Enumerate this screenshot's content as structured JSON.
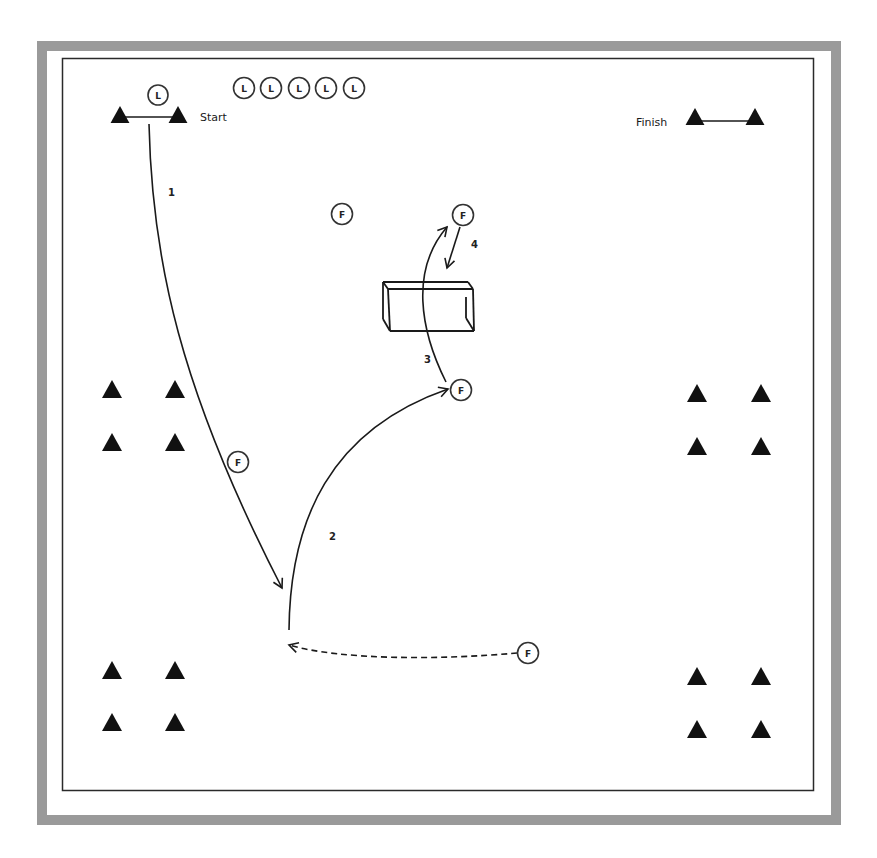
{
  "diagram": {
    "title": "",
    "frame": {
      "outer_color": "#9a9a9a",
      "line_color": "#2a2a2a",
      "background": "#ffffff"
    },
    "labels": {
      "start": "Start",
      "finish": "Finish"
    },
    "players": {
      "leader_start": {
        "letter": "L",
        "x": 158,
        "y": 95
      },
      "leaders_queue": [
        {
          "letter": "L",
          "x": 244,
          "y": 88
        },
        {
          "letter": "L",
          "x": 271,
          "y": 88
        },
        {
          "letter": "L",
          "x": 299,
          "y": 88
        },
        {
          "letter": "L",
          "x": 326,
          "y": 88
        },
        {
          "letter": "L",
          "x": 354,
          "y": 88
        }
      ],
      "followers": [
        {
          "letter": "F",
          "x": 342,
          "y": 214
        },
        {
          "letter": "F",
          "x": 463,
          "y": 215
        },
        {
          "letter": "F",
          "x": 461,
          "y": 390
        },
        {
          "letter": "F",
          "x": 238,
          "y": 462
        },
        {
          "letter": "F",
          "x": 528,
          "y": 653
        }
      ]
    },
    "cones": {
      "start_gate": [
        {
          "x": 120,
          "y": 115
        },
        {
          "x": 178,
          "y": 115
        }
      ],
      "finish_gate": [
        {
          "x": 695,
          "y": 117
        },
        {
          "x": 755,
          "y": 117
        }
      ],
      "left_mid": [
        {
          "x": 112,
          "y": 389
        },
        {
          "x": 175,
          "y": 389
        },
        {
          "x": 112,
          "y": 442
        },
        {
          "x": 175,
          "y": 442
        }
      ],
      "left_bottom": [
        {
          "x": 112,
          "y": 670
        },
        {
          "x": 175,
          "y": 670
        },
        {
          "x": 112,
          "y": 722
        },
        {
          "x": 175,
          "y": 722
        }
      ],
      "right_mid": [
        {
          "x": 697,
          "y": 393
        },
        {
          "x": 761,
          "y": 393
        },
        {
          "x": 697,
          "y": 446
        },
        {
          "x": 761,
          "y": 446
        }
      ],
      "right_bottom": [
        {
          "x": 697,
          "y": 676
        },
        {
          "x": 761,
          "y": 676
        },
        {
          "x": 697,
          "y": 729
        },
        {
          "x": 761,
          "y": 729
        }
      ]
    },
    "paths": [
      {
        "label": "1",
        "style": "solid",
        "label_pos": {
          "x": 172,
          "y": 196
        }
      },
      {
        "label": "2",
        "style": "solid",
        "label_pos": {
          "x": 333,
          "y": 540
        }
      },
      {
        "label": "3",
        "style": "solid",
        "label_pos": {
          "x": 428,
          "y": 363
        }
      },
      {
        "label": "4",
        "style": "solid",
        "label_pos": {
          "x": 474,
          "y": 248
        }
      },
      {
        "label": "",
        "style": "dashed"
      }
    ],
    "goal": {
      "type": "mini-goal"
    }
  }
}
